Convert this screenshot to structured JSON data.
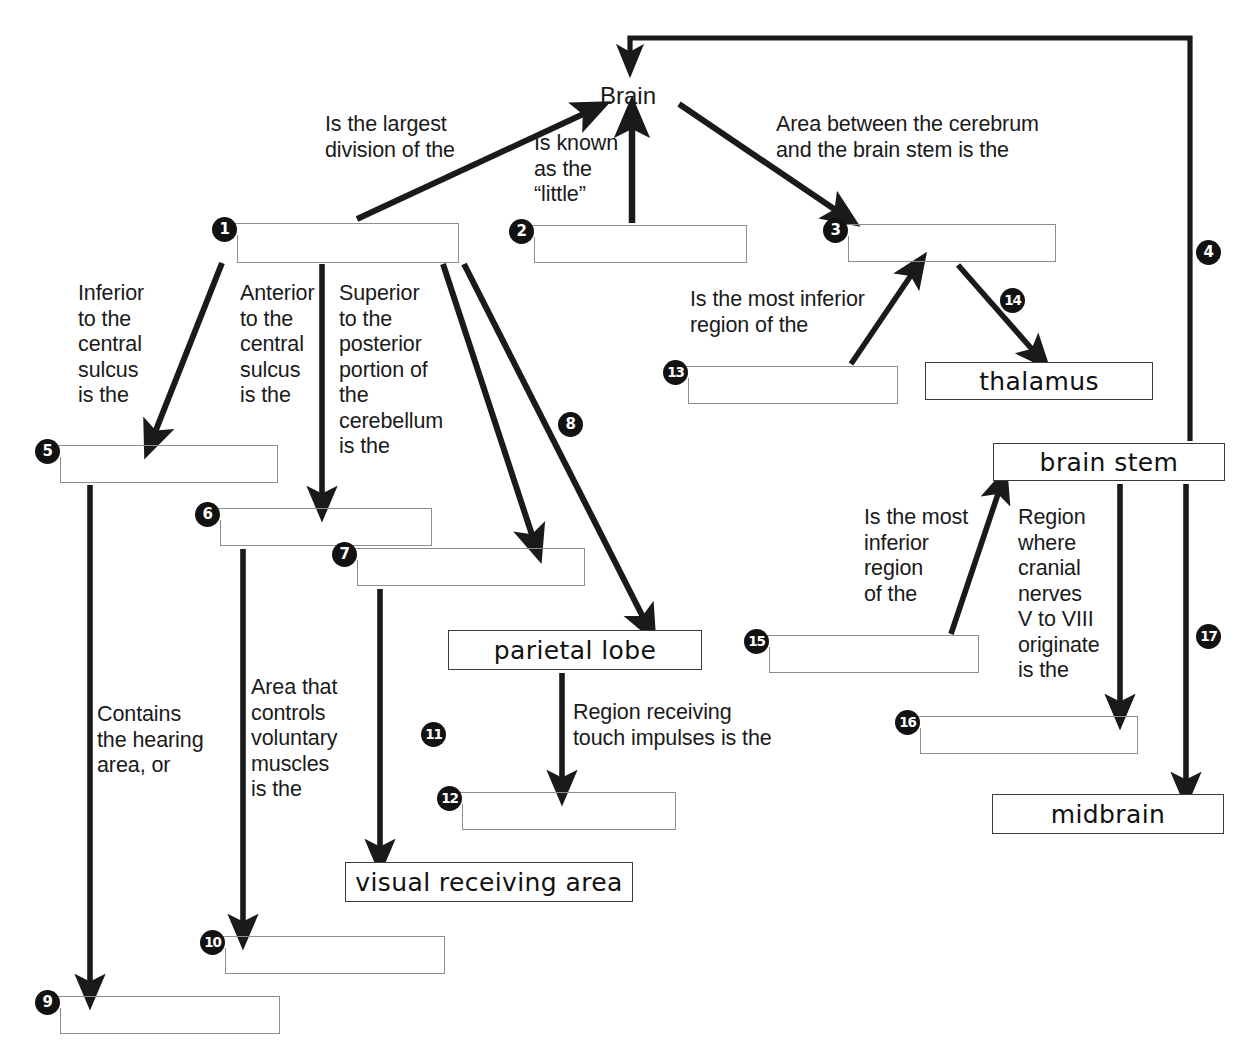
{
  "diagram": {
    "root_node": "Brain",
    "ink_color": "#1a1a1a",
    "blank_border_color": "#8d8d8d"
  },
  "nodes": [
    {
      "id": "brain",
      "label": "Brain",
      "kind": "plain",
      "x": 600,
      "y": 84,
      "w": 70,
      "h": 30
    },
    {
      "id": "thalamus",
      "label": "thalamus",
      "kind": "filled",
      "x": 925,
      "y": 362,
      "w": 228,
      "h": 38
    },
    {
      "id": "parietal",
      "label": "parietal lobe",
      "kind": "filled",
      "x": 448,
      "y": 630,
      "w": 254,
      "h": 40
    },
    {
      "id": "visual",
      "label": "visual receiving area",
      "kind": "filled",
      "x": 345,
      "y": 862,
      "w": 288,
      "h": 40
    },
    {
      "id": "brainstem",
      "label": "brain stem",
      "kind": "filled",
      "x": 993,
      "y": 443,
      "w": 232,
      "h": 38
    },
    {
      "id": "midbrain",
      "label": "midbrain",
      "kind": "filled",
      "x": 992,
      "y": 794,
      "w": 232,
      "h": 40
    }
  ],
  "blanks": [
    {
      "num": "1",
      "x": 225,
      "y": 223,
      "w": 234,
      "h": 40,
      "answer": ""
    },
    {
      "num": "2",
      "x": 522,
      "y": 225,
      "w": 225,
      "h": 38,
      "answer": ""
    },
    {
      "num": "3",
      "x": 836,
      "y": 224,
      "w": 220,
      "h": 38,
      "answer": ""
    },
    {
      "num": "5",
      "x": 48,
      "y": 445,
      "w": 230,
      "h": 38,
      "answer": ""
    },
    {
      "num": "6",
      "x": 208,
      "y": 508,
      "w": 224,
      "h": 38,
      "answer": ""
    },
    {
      "num": "7",
      "x": 345,
      "y": 548,
      "w": 240,
      "h": 38,
      "answer": ""
    },
    {
      "num": "9",
      "x": 48,
      "y": 996,
      "w": 232,
      "h": 38,
      "answer": ""
    },
    {
      "num": "10",
      "x": 213,
      "y": 936,
      "w": 232,
      "h": 38,
      "answer": ""
    },
    {
      "num": "12",
      "x": 450,
      "y": 792,
      "w": 226,
      "h": 38,
      "answer": ""
    },
    {
      "num": "13",
      "x": 676,
      "y": 366,
      "w": 222,
      "h": 38,
      "answer": ""
    },
    {
      "num": "15",
      "x": 757,
      "y": 635,
      "w": 222,
      "h": 38,
      "answer": ""
    },
    {
      "num": "16",
      "x": 908,
      "y": 716,
      "w": 230,
      "h": 38,
      "answer": ""
    }
  ],
  "edge_badges": [
    {
      "num": "4",
      "x": 1196,
      "y": 240
    },
    {
      "num": "8",
      "x": 558,
      "y": 412
    },
    {
      "num": "11",
      "x": 421,
      "y": 722
    },
    {
      "num": "14",
      "x": 1000,
      "y": 288
    },
    {
      "num": "17",
      "x": 1196,
      "y": 624
    }
  ],
  "prompts": [
    {
      "id": "p-largest-division",
      "text": "Is the largest\ndivision of the",
      "x": 325,
      "y": 112,
      "w": 230,
      "align": "left"
    },
    {
      "id": "p-known-as-little",
      "text": "Is known\nas the\n“little”",
      "x": 534,
      "y": 131,
      "w": 120,
      "align": "left"
    },
    {
      "id": "p-between-cerebrum",
      "text": "Area between the cerebrum\nand the brain stem is the",
      "x": 776,
      "y": 112,
      "w": 340,
      "align": "left"
    },
    {
      "id": "p-inferior-central",
      "text": "Inferior\nto the\ncentral\nsulcus\nis the",
      "x": 78,
      "y": 281,
      "w": 110,
      "align": "left"
    },
    {
      "id": "p-anterior-central",
      "text": "Anterior\nto the\ncentral\nsulcus\nis the",
      "x": 240,
      "y": 281,
      "w": 110,
      "align": "left"
    },
    {
      "id": "p-superior-posterior",
      "text": "Superior\nto the\nposterior\nportion of\nthe\ncerebellum\nis the",
      "x": 339,
      "y": 281,
      "w": 125,
      "align": "left"
    },
    {
      "id": "p-most-inferior-13",
      "text": "Is the most inferior\nregion of the",
      "x": 690,
      "y": 287,
      "w": 260,
      "align": "left"
    },
    {
      "id": "p-contains-hearing",
      "text": "Contains\nthe hearing\narea, or",
      "x": 97,
      "y": 702,
      "w": 130,
      "align": "left"
    },
    {
      "id": "p-voluntary-muscles",
      "text": "Area that\ncontrols\nvoluntary\nmuscles\nis the",
      "x": 251,
      "y": 675,
      "w": 120,
      "align": "left"
    },
    {
      "id": "p-touch-impulses",
      "text": "Region receiving\ntouch impulses is the",
      "x": 573,
      "y": 700,
      "w": 250,
      "align": "left"
    },
    {
      "id": "p-most-inferior-15",
      "text": "Is the most\ninferior\nregion\nof the",
      "x": 864,
      "y": 505,
      "w": 115,
      "align": "left"
    },
    {
      "id": "p-cranial-nerves",
      "text": "Region\nwhere\ncranial\nnerves\nV to VIII\noriginate\nis the",
      "x": 1018,
      "y": 505,
      "w": 120,
      "align": "left"
    }
  ],
  "connectors": [
    {
      "id": "c-brainstem-to-brain-return",
      "kind": "polyline",
      "label_num": "4",
      "points": "1190,441 1190,38 630,38 630,62"
    },
    {
      "id": "c-1-to-brain",
      "kind": "arrow",
      "label_num": "",
      "points": "357,218 595,108"
    },
    {
      "id": "c-2-to-brain",
      "kind": "arrow",
      "label_num": "",
      "points": "632,222 632,115"
    },
    {
      "id": "c-brain-to-3",
      "kind": "arrow",
      "label_num": "",
      "points": "680,104 845,216"
    },
    {
      "id": "c-1-to-5",
      "kind": "arrow",
      "label_num": "",
      "points": "222,262 152,442"
    },
    {
      "id": "c-1-to-6",
      "kind": "arrow",
      "label_num": "",
      "points": "322,263 322,505"
    },
    {
      "id": "c-1-to-7",
      "kind": "arrow",
      "label_num": "",
      "points": "444,263 534,545"
    },
    {
      "id": "c-1-to-parietal",
      "kind": "arrow",
      "label_num": "8",
      "points": "462,263 645,627"
    },
    {
      "id": "c-5-to-9",
      "kind": "arrow",
      "label_num": "",
      "points": "90,484 90,993"
    },
    {
      "id": "c-6-to-10",
      "kind": "arrow",
      "label_num": "",
      "points": "243,548 243,933"
    },
    {
      "id": "c-7-to-visual",
      "kind": "arrow",
      "label_num": "11",
      "points": "380,588 380,858"
    },
    {
      "id": "c-parietal-to-12",
      "kind": "arrow",
      "label_num": "",
      "points": "562,672 562,789"
    },
    {
      "id": "c-13-to-3",
      "kind": "arrow",
      "label_num": "",
      "points": "853,363 914,271"
    },
    {
      "id": "c-3-to-thalamus",
      "kind": "arrow",
      "label_num": "14",
      "points": "959,265 1037,358"
    },
    {
      "id": "c-15-to-brainstem",
      "kind": "arrow",
      "label_num": "",
      "points": "952,633 1000,487"
    },
    {
      "id": "c-brainstem-to-16",
      "kind": "arrow",
      "label_num": "",
      "points": "1120,483 1120,713"
    },
    {
      "id": "c-brainstem-to-midbrain",
      "kind": "arrow",
      "label_num": "17",
      "points": "1186,483 1186,790"
    }
  ]
}
